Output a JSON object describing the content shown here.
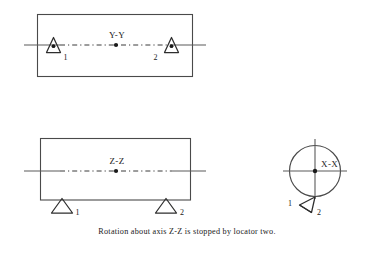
{
  "figure": {
    "background_color": "#ffffff",
    "line_color": "#4a4a4a",
    "text_color": "#1a1a1a",
    "caption": "Rotation about axis Z-Z is stopped by locator two."
  },
  "views": {
    "top_view": {
      "name": "plan-view-y-axis",
      "axis_label": "Y-Y",
      "locators": [
        {
          "id": "1",
          "label": "1"
        },
        {
          "id": "2",
          "label": "2"
        }
      ]
    },
    "front_view": {
      "name": "front-view-z-axis",
      "axis_label": "Z-Z",
      "locators": [
        {
          "id": "1",
          "label": "1"
        },
        {
          "id": "2",
          "label": "2"
        }
      ]
    },
    "end_view": {
      "name": "end-view-x-axis",
      "axis_label": "X-X",
      "locators": [
        {
          "id": "1",
          "label": "1"
        },
        {
          "id": "2",
          "label": "2"
        }
      ]
    }
  }
}
